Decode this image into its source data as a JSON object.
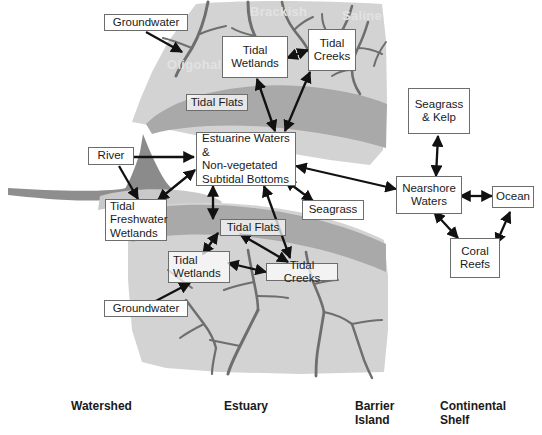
{
  "figure": {
    "palette": {
      "land_light": "#d2d2d2",
      "land_mid": "#c0c0c0",
      "tidal_flat_band": "#a9a9a9",
      "delta_dark": "#8b8b8b",
      "river_line": "#8a8a8a",
      "creek_line": "#6e6e6e",
      "box_border": "#6d6d6d",
      "box_fill": "#ffffff",
      "arrow": "#111111",
      "text": "#1a1a1a",
      "watermark": "#e2e2e2",
      "background": "#ffffff"
    }
  },
  "nodes": {
    "groundwater_top": {
      "label": "Groundwater"
    },
    "groundwater_bottom": {
      "label": "Groundwater"
    },
    "tidal_wetlands_top": {
      "label": "Tidal\nWetlands"
    },
    "tidal_creeks_top": {
      "label": "Tidal\nCreeks"
    },
    "tidal_flats_top": {
      "label": "Tidal Flats"
    },
    "river": {
      "label": "River"
    },
    "estuarine_waters": {
      "label": "Estuarine Waters &\nNon-vegetated\nSubtidal Bottoms"
    },
    "tidal_freshwater_wetlands": {
      "label": "Tidal\nFreshwater\nWetlands"
    },
    "seagrass": {
      "label": "Seagrass"
    },
    "tidal_flats_bottom": {
      "label": "Tidal Flats"
    },
    "tidal_wetlands_bottom": {
      "label": "Tidal\nWetlands"
    },
    "tidal_creeks_bottom": {
      "label": "Tidal Creeks"
    },
    "seagrass_kelp": {
      "label": "Seagrass\n& Kelp"
    },
    "nearshore_waters": {
      "label": "Nearshore\nWaters"
    },
    "ocean": {
      "label": "Ocean"
    },
    "coral_reefs": {
      "label": "Coral\nReefs"
    }
  },
  "watermarks": {
    "brackish": "Brackish",
    "saline": "Saline",
    "oligohaline": "Oligohaline"
  },
  "zone_labels": {
    "watershed": "Watershed",
    "estuary": "Estuary",
    "barrier_island": "Barrier\nIsland",
    "continental_shelf": "Continental\nShelf"
  },
  "connections": [
    {
      "from": "groundwater_top",
      "to": "estuary_upper_marsh",
      "direction": "one-way"
    },
    {
      "from": "groundwater_bottom",
      "to": "estuary_lower_marsh",
      "direction": "one-way"
    },
    {
      "from": "tidal_wetlands_top",
      "to": "tidal_creeks_top",
      "direction": "two-way"
    },
    {
      "from": "tidal_wetlands_top",
      "to": "estuarine_waters",
      "direction": "two-way"
    },
    {
      "from": "tidal_creeks_top",
      "to": "estuarine_waters",
      "direction": "two-way"
    },
    {
      "from": "river",
      "to": "estuarine_waters",
      "direction": "one-way"
    },
    {
      "from": "river",
      "to": "tidal_freshwater_wetlands",
      "direction": "one-way"
    },
    {
      "from": "tidal_freshwater_wetlands",
      "to": "estuarine_waters",
      "direction": "two-way"
    },
    {
      "from": "estuarine_waters",
      "to": "tidal_flats_bottom",
      "direction": "two-way"
    },
    {
      "from": "estuarine_waters",
      "to": "tidal_creeks_bottom",
      "direction": "two-way"
    },
    {
      "from": "estuarine_waters",
      "to": "seagrass",
      "direction": "two-way"
    },
    {
      "from": "estuarine_waters",
      "to": "nearshore_waters",
      "direction": "two-way"
    },
    {
      "from": "tidal_flats_bottom",
      "to": "tidal_wetlands_bottom",
      "direction": "two-way"
    },
    {
      "from": "tidal_flats_bottom",
      "to": "tidal_creeks_bottom",
      "direction": "two-way"
    },
    {
      "from": "tidal_wetlands_bottom",
      "to": "tidal_creeks_bottom",
      "direction": "two-way"
    },
    {
      "from": "nearshore_waters",
      "to": "seagrass_kelp",
      "direction": "two-way"
    },
    {
      "from": "nearshore_waters",
      "to": "ocean",
      "direction": "two-way"
    },
    {
      "from": "nearshore_waters",
      "to": "coral_reefs",
      "direction": "two-way"
    },
    {
      "from": "coral_reefs",
      "to": "ocean",
      "direction": "two-way"
    }
  ]
}
